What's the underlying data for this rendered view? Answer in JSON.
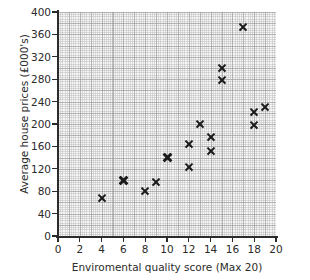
{
  "chart_data": {
    "type": "scatter",
    "title": "",
    "xlabel": "Enviromental quality score (Max 20)",
    "ylabel": "Average house prices (£000's)",
    "xlim": [
      0,
      20
    ],
    "ylim": [
      0,
      400
    ],
    "xticks": [
      0,
      2,
      4,
      6,
      8,
      10,
      12,
      14,
      16,
      18,
      20
    ],
    "yticks": [
      0,
      40,
      80,
      120,
      160,
      200,
      240,
      280,
      320,
      360,
      400
    ],
    "xtick_labels": [
      "0",
      "2",
      "4",
      "6",
      "8",
      "10",
      "12",
      "14",
      "16",
      "18",
      "20"
    ],
    "ytick_labels": [
      "0",
      "40",
      "80",
      "120",
      "160",
      "200",
      "240",
      "280",
      "320",
      "360",
      "400"
    ],
    "grid": true,
    "grid_style": "fine graph paper, minor every 0.2 x-units / 4 y-units, major every 1 x-unit / 20 y-units",
    "legend": null,
    "marker_style": "x",
    "marker_color": "#1a1a1a",
    "plot_background": "#f7f7f7",
    "points": [
      {
        "x": 4,
        "y": 67,
        "bold": false
      },
      {
        "x": 6,
        "y": 100,
        "bold": true
      },
      {
        "x": 8,
        "y": 80,
        "bold": false
      },
      {
        "x": 9,
        "y": 97,
        "bold": false
      },
      {
        "x": 10,
        "y": 140,
        "bold": true
      },
      {
        "x": 12,
        "y": 165,
        "bold": false
      },
      {
        "x": 12,
        "y": 124,
        "bold": false
      },
      {
        "x": 13,
        "y": 200,
        "bold": false
      },
      {
        "x": 14,
        "y": 176,
        "bold": false
      },
      {
        "x": 14,
        "y": 151,
        "bold": false
      },
      {
        "x": 15,
        "y": 300,
        "bold": false
      },
      {
        "x": 15,
        "y": 279,
        "bold": false
      },
      {
        "x": 17,
        "y": 373,
        "bold": false
      },
      {
        "x": 18,
        "y": 221,
        "bold": false
      },
      {
        "x": 18,
        "y": 198,
        "bold": false
      },
      {
        "x": 19,
        "y": 231,
        "bold": false
      }
    ]
  }
}
